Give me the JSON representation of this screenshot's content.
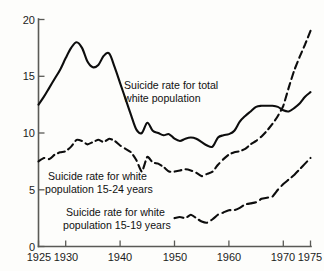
{
  "chart_data": {
    "type": "line",
    "title": "",
    "subtitle": "",
    "xlabel": "",
    "ylabel": "",
    "xlim": [
      1925,
      1975
    ],
    "ylim": [
      0,
      20
    ],
    "grid": false,
    "legend_position": "inline-annotations",
    "x_ticks": [
      1925,
      1930,
      1940,
      1950,
      1960,
      1970,
      1975
    ],
    "x_tick_labels": [
      "1925",
      "1930",
      "1940",
      "1950",
      "1960",
      "1970",
      "1975"
    ],
    "y_ticks": [
      0,
      5,
      10,
      15,
      20
    ],
    "y_tick_labels": [
      "0",
      "5",
      "10",
      "15",
      "20"
    ],
    "series": [
      {
        "name": "Suicide rate for total white population",
        "style": "solid",
        "x": [
          1925,
          1926,
          1927,
          1928,
          1929,
          1930,
          1931,
          1932,
          1933,
          1934,
          1935,
          1936,
          1937,
          1938,
          1939,
          1940,
          1941,
          1942,
          1943,
          1944,
          1945,
          1946,
          1947,
          1948,
          1949,
          1950,
          1951,
          1952,
          1953,
          1954,
          1955,
          1956,
          1957,
          1958,
          1959,
          1960,
          1961,
          1962,
          1963,
          1964,
          1965,
          1966,
          1967,
          1968,
          1969,
          1970,
          1971,
          1972,
          1973,
          1974,
          1975
        ],
        "values": [
          12.5,
          13.2,
          14.0,
          14.8,
          15.6,
          16.6,
          17.5,
          18.0,
          17.5,
          16.3,
          15.8,
          16.0,
          16.8,
          17.0,
          15.8,
          14.4,
          13.0,
          11.6,
          10.3,
          10.0,
          10.9,
          10.2,
          10.0,
          9.8,
          9.9,
          9.5,
          9.3,
          9.5,
          9.6,
          9.5,
          9.2,
          8.9,
          8.8,
          9.6,
          9.8,
          9.9,
          10.2,
          11.0,
          11.5,
          11.9,
          12.3,
          12.4,
          12.4,
          12.4,
          12.3,
          12.0,
          11.9,
          12.2,
          12.6,
          13.2,
          13.6
        ],
        "annotation": "Suicide rate for total\nwhite population"
      },
      {
        "name": "Suicide rate for white population 15-24 years",
        "style": "dashed",
        "x": [
          1925,
          1926,
          1927,
          1928,
          1929,
          1930,
          1931,
          1932,
          1933,
          1934,
          1935,
          1936,
          1937,
          1938,
          1939,
          1940,
          1941,
          1942,
          1943,
          1944,
          1945,
          1946,
          1947,
          1948,
          1949,
          1950,
          1951,
          1952,
          1953,
          1954,
          1955,
          1956,
          1957,
          1958,
          1959,
          1960,
          1961,
          1962,
          1963,
          1964,
          1965,
          1966,
          1967,
          1968,
          1969,
          1970,
          1971,
          1972,
          1973,
          1974,
          1975
        ],
        "values": [
          7.5,
          7.8,
          7.7,
          8.1,
          8.3,
          8.4,
          8.8,
          9.4,
          9.3,
          9.0,
          9.2,
          9.4,
          9.2,
          9.5,
          9.3,
          8.9,
          8.6,
          8.3,
          7.6,
          6.6,
          7.9,
          7.4,
          7.3,
          7.0,
          6.6,
          6.6,
          6.7,
          6.8,
          6.7,
          6.5,
          6.2,
          6.4,
          6.6,
          7.2,
          7.7,
          8.1,
          8.3,
          8.4,
          8.6,
          9.0,
          9.3,
          9.7,
          10.2,
          10.8,
          11.5,
          12.4,
          14.0,
          15.5,
          16.7,
          17.8,
          19.0
        ],
        "annotation": "Suicide rate for white\npopulation 15-24 years"
      },
      {
        "name": "Suicide rate for white population 15-19 years",
        "style": "dashdot",
        "x": [
          1950,
          1951,
          1952,
          1953,
          1954,
          1955,
          1956,
          1957,
          1958,
          1959,
          1960,
          1961,
          1962,
          1963,
          1964,
          1965,
          1966,
          1967,
          1968,
          1969,
          1970,
          1971,
          1972,
          1973,
          1974,
          1975
        ],
        "values": [
          2.5,
          2.6,
          2.5,
          2.8,
          2.5,
          2.2,
          2.1,
          2.4,
          2.8,
          3.0,
          3.2,
          3.2,
          3.4,
          3.7,
          3.8,
          3.9,
          4.2,
          4.3,
          4.4,
          5.0,
          5.5,
          5.9,
          6.3,
          6.8,
          7.3,
          7.8
        ],
        "annotation": "Suicide rate for white\npopulation 15-19 years"
      }
    ],
    "annotations": [
      {
        "id": "annot-total",
        "line1": "Suicide rate for total",
        "line2": "white population"
      },
      {
        "id": "annot-15-24",
        "line1": "Suicide rate for white",
        "line2": "population 15-24 years"
      },
      {
        "id": "annot-15-19",
        "line1": "Suicide rate for white",
        "line2": "population 15-19 years"
      }
    ]
  },
  "colors": {
    "background": "#fdfdfb",
    "line": "#0d0d0d",
    "axis": "#5a5a56",
    "text": "#111111"
  }
}
